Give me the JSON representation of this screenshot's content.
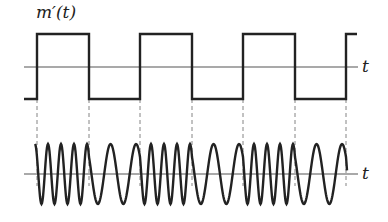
{
  "diagram": {
    "message_label": "m′(t)",
    "top_axis_label": "t",
    "bottom_axis_label": "t",
    "transitions_x": [
      37,
      89,
      140,
      192,
      243,
      295,
      346
    ],
    "square_wave": {
      "start_x": 24,
      "end_x": 357,
      "high_y": 34,
      "low_y": 99,
      "axis_y": 67,
      "initial_level": "low",
      "end_level": "high"
    },
    "fm_wave": {
      "axis_y": 174,
      "amplitude": 30,
      "high_cycles_per_segment": 4,
      "low_cycles_per_segment": 2
    },
    "colors": {
      "stroke": "#222222",
      "axis": "#555555",
      "dashed": "#777777"
    }
  }
}
